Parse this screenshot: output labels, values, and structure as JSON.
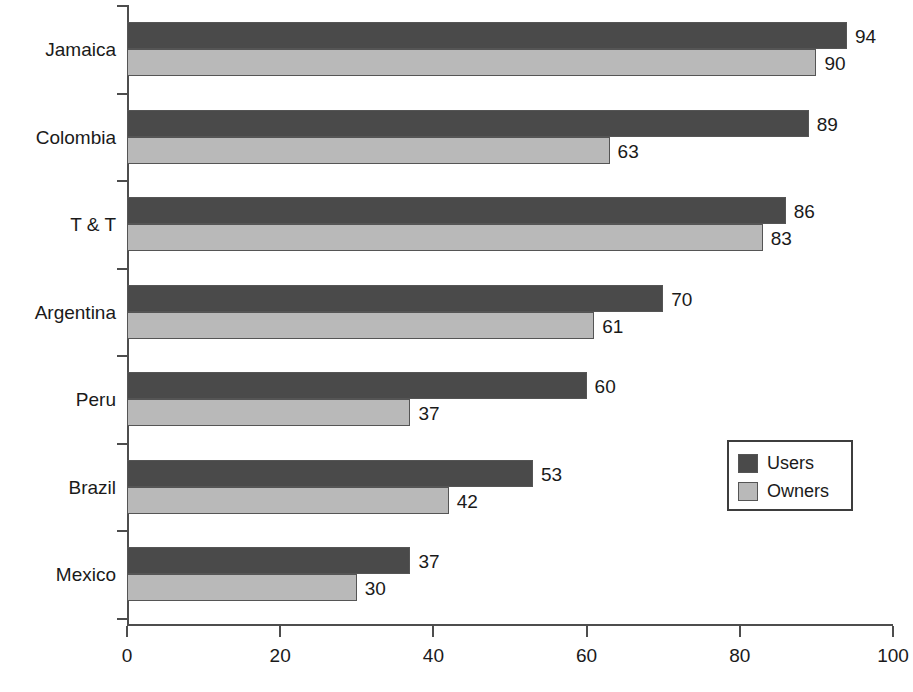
{
  "chart_data": {
    "type": "bar",
    "orientation": "horizontal",
    "title": "",
    "xlabel": "",
    "ylabel": "",
    "xlim": [
      0,
      100
    ],
    "xticks": [
      "0",
      "20",
      "40",
      "60",
      "80",
      "100"
    ],
    "grid": false,
    "legend_position": "inner-right",
    "categories": [
      "Jamaica",
      "Colombia",
      "T & T",
      "Argentina",
      "Peru",
      "Brazil",
      "Mexico"
    ],
    "series": [
      {
        "name": "Users",
        "color": "#4a4a4a",
        "values": [
          94,
          89,
          86,
          70,
          60,
          53,
          37
        ]
      },
      {
        "name": "Owners",
        "color": "#b9b9b9",
        "values": [
          90,
          63,
          83,
          61,
          37,
          42,
          30
        ]
      }
    ],
    "data_labels": {
      "Jamaica": {
        "Users": "94",
        "Owners": "90"
      },
      "Colombia": {
        "Users": "89",
        "Owners": "63"
      },
      "T & T": {
        "Users": "86",
        "Owners": "83"
      },
      "Argentina": {
        "Users": "70",
        "Owners": "61"
      },
      "Peru": {
        "Users": "60",
        "Owners": "37"
      },
      "Brazil": {
        "Users": "53",
        "Owners": "42"
      },
      "Mexico": {
        "Users": "37",
        "Owners": "30"
      }
    }
  },
  "legend": {
    "entries": [
      {
        "label": "Users"
      },
      {
        "label": "Owners"
      }
    ]
  },
  "axis": {
    "x_tick_labels": [
      "0",
      "20",
      "40",
      "60",
      "80",
      "100"
    ]
  }
}
